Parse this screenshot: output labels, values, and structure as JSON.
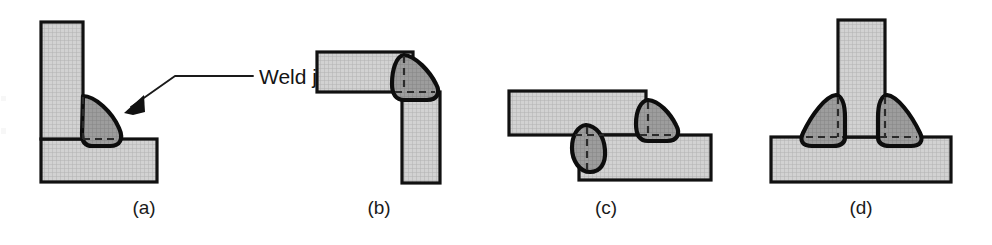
{
  "figure": {
    "callout": {
      "label": "Weld joint",
      "points_to_panel": "a"
    },
    "colors": {
      "plate_fill": "#cfcfcf",
      "plate_hatch": "#b4b4b4",
      "bead_fill": "#9a9a9a",
      "bead_hatch": "#868686",
      "outline": "#111111",
      "hidden_line": "#2b2b2b",
      "background": "#ffffff",
      "text": "#141414"
    },
    "panels": [
      {
        "id": "a",
        "caption": "(a)",
        "joint_type": "corner-fillet joint",
        "description": "Vertical plate seated on a horizontal plate with a single fillet weld bead in the inside corner",
        "weld_count": 1
      },
      {
        "id": "b",
        "caption": "(b)",
        "joint_type": "corner joint",
        "description": "Horizontal plate meeting a downward vertical plate at an outside corner with one weld bead",
        "weld_count": 1
      },
      {
        "id": "c",
        "caption": "(c)",
        "joint_type": "lap joint",
        "description": "Two offset overlapping plates welded at both ends of the overlap",
        "weld_count": 2
      },
      {
        "id": "d",
        "caption": "(d)",
        "joint_type": "tee joint",
        "description": "Vertical plate standing on a base plate with symmetric fillet welds on both sides",
        "weld_count": 2
      }
    ]
  }
}
